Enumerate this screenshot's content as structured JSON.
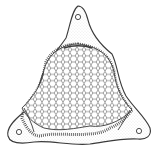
{
  "illustration": {
    "subject": "triangular diatom valve line drawing",
    "background": "#ffffff",
    "stroke": "#3a3a3a",
    "light_stroke": "#8a8a8a",
    "apices": [
      {
        "name": "top",
        "x": 78,
        "y": 8
      },
      {
        "name": "bottom-left",
        "x": 10,
        "y": 138
      },
      {
        "name": "bottom-right",
        "x": 148,
        "y": 137
      }
    ],
    "ocelli": [
      {
        "name": "top",
        "x": 78,
        "y": 17,
        "r": 2.6
      },
      {
        "name": "bottom-left",
        "x": 19,
        "y": 132,
        "r": 2.6
      },
      {
        "name": "bottom-right",
        "x": 139,
        "y": 131,
        "r": 2.6
      }
    ]
  }
}
